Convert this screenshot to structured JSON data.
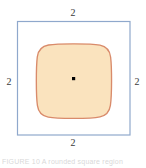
{
  "figure": {
    "title": "",
    "center_point_label": "",
    "labels": {
      "top": "2",
      "right": "2",
      "bottom": "2",
      "left": "2"
    },
    "colors": {
      "background": "#ffffff",
      "square_stroke": "#8fa8cc",
      "blob_stroke": "#d98b6b",
      "blob_fill": "#fae3be",
      "center_dot": "#000000",
      "label_text": "#3a3a3a"
    },
    "geometry": {
      "square": {
        "x": 17,
        "y": 21,
        "width": 113,
        "height": 114,
        "stroke_width": 1.2
      },
      "blob": {
        "cx": 74,
        "cy": 81,
        "half_extent": 37,
        "stroke_width": 1.3
      },
      "center_dot": {
        "cx": 73.5,
        "cy": 78.5,
        "size": 3
      }
    }
  },
  "caption": {
    "fragment": "FIGURE 10  A rounded square region"
  }
}
